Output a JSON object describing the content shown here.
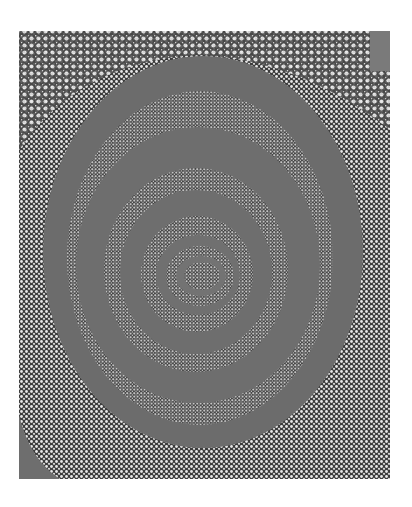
{
  "image": {
    "description": "Monochrome dot painting of concentric oval rings",
    "subject": "concentric-rings-dot-painting",
    "colors": {
      "background": "#ffffff",
      "dots_dark_ground": "#3a3a3a",
      "dots_light": "#e8e8e8",
      "band_gray": "#6e6e6e"
    },
    "rings": [
      {
        "name": "outer-band",
        "cx": 205,
        "cy": 250,
        "rx_out": 162,
        "ry_out": 197,
        "width": 28
      },
      {
        "name": "middle-band",
        "cx": 200,
        "cy": 262,
        "rx_out": 120,
        "ry_out": 138,
        "width": 30
      },
      {
        "name": "inner-band",
        "cx": 200,
        "cy": 270,
        "rx_out": 72,
        "ry_out": 78,
        "width": 22
      },
      {
        "name": "core-band",
        "cx": 200,
        "cy": 272,
        "rx_out": 32,
        "ry_out": 30,
        "width": 8
      }
    ]
  }
}
